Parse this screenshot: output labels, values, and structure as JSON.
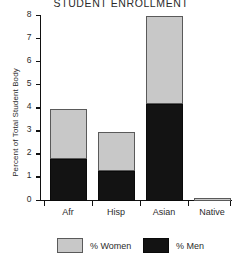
{
  "chart_data": {
    "type": "bar",
    "subtype": "stacked-bar",
    "title": "STUDENT ENROLLMENT",
    "xlabel": "",
    "ylabel": "Percent of Total Student Body",
    "categories": [
      "Afr",
      "Hisp",
      "Asian",
      "Native"
    ],
    "series": [
      {
        "name": "% Men",
        "values": [
          1.8,
          1.3,
          4.2,
          0.0
        ],
        "color": "#131313"
      },
      {
        "name": "% Women",
        "values": [
          2.2,
          1.7,
          3.8,
          0.1
        ],
        "color": "#c8c8c8"
      }
    ],
    "totals": [
      4.0,
      3.0,
      8.0,
      0.1
    ],
    "ylim": [
      0,
      8
    ],
    "yticks": [
      0,
      1,
      2,
      3,
      4,
      5,
      6,
      7,
      8
    ],
    "ytick_labels": [
      "0",
      "1",
      "2",
      "3",
      "4",
      "5",
      "6",
      "7",
      "8"
    ],
    "grid": false,
    "legend": {
      "position": "bottom",
      "entries": [
        {
          "label": "% Women",
          "color": "#c8c8c8"
        },
        {
          "label": "% Men",
          "color": "#131313"
        }
      ]
    }
  },
  "colors": {
    "women": "#c8c8c8",
    "men": "#131313",
    "axis": "#111111",
    "text": "#2b2b2b",
    "background": "#ffffff"
  }
}
